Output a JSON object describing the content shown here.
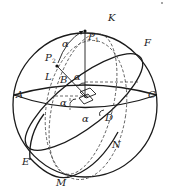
{
  "figure": {
    "type": "celestial sphere / spherical geometry diagram",
    "labels": {
      "K": "K",
      "P1": "P",
      "P1_sub": "1",
      "P2": "P",
      "P2_sub": "2",
      "F": "F",
      "L": "L",
      "B": "B",
      "A": "A",
      "C": "C",
      "D": "D",
      "E": "E",
      "M": "M",
      "N": "N",
      "alpha_arc": "α",
      "alpha_top": "α",
      "alpha_left": "α",
      "alpha_bottom": "α"
    },
    "colors": {
      "line": "#1a1a1a",
      "background": "#ffffff"
    }
  }
}
